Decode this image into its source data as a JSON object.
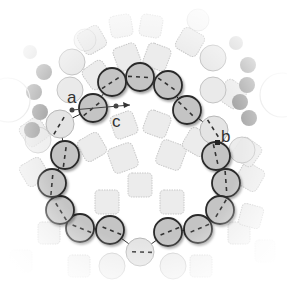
{
  "diagram": {
    "labels": [
      {
        "id": "a",
        "text": "a",
        "x": 68,
        "y": 102
      },
      {
        "id": "c",
        "text": "c",
        "x": 114,
        "y": 127
      },
      {
        "id": "b",
        "text": "b",
        "x": 222,
        "y": 141
      }
    ],
    "colors": {
      "chain_fill": "#c4c4c4",
      "chain_stroke": "#2b2b2b",
      "light_fill": "#e4e4e4",
      "light_stroke": "#b8b8b8",
      "bg_square_fill": "#ececec",
      "bg_square_stroke": "#c8c8c8",
      "dark_dot_fill": "#a8a8a8"
    },
    "chain_radius": 14,
    "chain": [
      {
        "x": 93,
        "y": 108,
        "type": "dark"
      },
      {
        "x": 112,
        "y": 82,
        "type": "dark"
      },
      {
        "x": 140,
        "y": 77,
        "type": "dark"
      },
      {
        "x": 168,
        "y": 85,
        "type": "dark"
      },
      {
        "x": 187,
        "y": 110,
        "type": "dark"
      },
      {
        "x": 214,
        "y": 130,
        "type": "light"
      },
      {
        "x": 216,
        "y": 156,
        "type": "dark"
      },
      {
        "x": 226,
        "y": 183,
        "type": "dark"
      },
      {
        "x": 220,
        "y": 210,
        "type": "dark"
      },
      {
        "x": 198,
        "y": 229,
        "type": "dark"
      },
      {
        "x": 168,
        "y": 232,
        "type": "dark"
      },
      {
        "x": 140,
        "y": 252,
        "type": "light"
      },
      {
        "x": 110,
        "y": 230,
        "type": "dark"
      },
      {
        "x": 80,
        "y": 228,
        "type": "dark"
      },
      {
        "x": 60,
        "y": 210,
        "type": "dark"
      },
      {
        "x": 52,
        "y": 183,
        "type": "dark"
      },
      {
        "x": 65,
        "y": 155,
        "type": "dark"
      },
      {
        "x": 60,
        "y": 124,
        "type": "light"
      }
    ]
  }
}
